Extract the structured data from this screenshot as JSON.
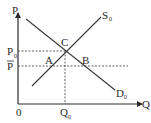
{
  "diagram": {
    "type": "supply-demand",
    "axes": {
      "y_label": "P",
      "x_label": "Q",
      "origin_label": "0"
    },
    "curves": {
      "supply": {
        "label": "S",
        "subscript": "0"
      },
      "demand": {
        "label": "D",
        "subscript": "0"
      }
    },
    "price_levels": {
      "equilibrium": {
        "label": "P",
        "subscript": "0"
      },
      "ceiling": {
        "label": "P",
        "overline": true
      }
    },
    "quantity_levels": {
      "equilibrium": {
        "label": "Q",
        "subscript": "0"
      }
    },
    "points": {
      "A": "A",
      "B": "B",
      "C": "C"
    },
    "colors": {
      "line": "#3a3a3a",
      "text": "#2a2a2a",
      "background": "#ffffff"
    }
  }
}
